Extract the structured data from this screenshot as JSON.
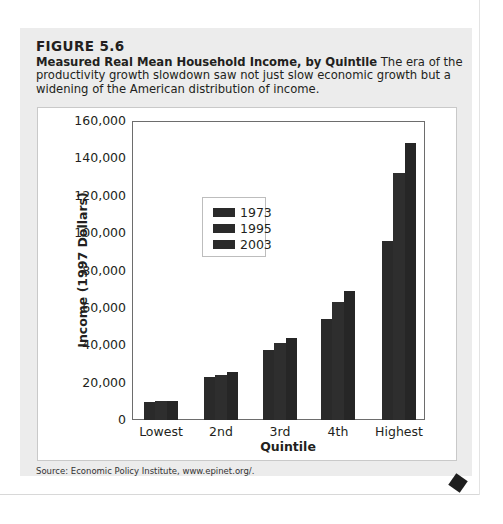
{
  "figure": {
    "label": "FIGURE 5.6",
    "title": "Measured Real Mean Household Income, by Quintile",
    "description": "The era of the productivity growth slowdown saw not just slow economic growth but a widening of the American distribution of income.",
    "source": "Source: Economic Policy Institute, www.epinet.org/."
  },
  "chart_data": {
    "type": "bar",
    "title": "Measured Real Mean Household Income, by Quintile",
    "xlabel": "Quintile",
    "ylabel": "Income (1997 Dollars)",
    "categories": [
      "Lowest",
      "2nd",
      "3rd",
      "4th",
      "Highest"
    ],
    "series": [
      {
        "name": "1973",
        "values": [
          9600,
          23000,
          37400,
          53800,
          95800
        ]
      },
      {
        "name": "1995",
        "values": [
          10400,
          24300,
          41000,
          63000,
          132000
        ]
      },
      {
        "name": "2003",
        "values": [
          10400,
          25800,
          43700,
          69200,
          148000
        ]
      }
    ],
    "ylim": [
      0,
      160000
    ],
    "yticks": [
      "0",
      "20,000",
      "40,000",
      "60,000",
      "80,000",
      "100,000",
      "120,000",
      "140,000",
      "160,000"
    ],
    "grid": false,
    "legend_position": "inside upper-left"
  }
}
